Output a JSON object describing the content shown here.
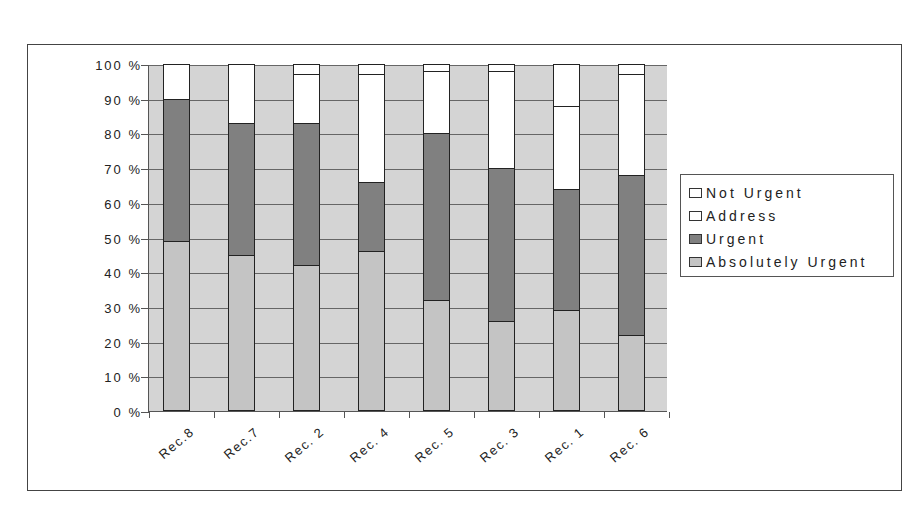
{
  "chart_data": {
    "type": "bar",
    "stacked": true,
    "percent_stacked": true,
    "title": "",
    "xlabel": "",
    "ylabel": "",
    "ylim": [
      0,
      100
    ],
    "yticks": [
      "0 %",
      "10 %",
      "20 %",
      "30 %",
      "40 %",
      "50 %",
      "60 %",
      "70 %",
      "80 %",
      "90 %",
      "100 %"
    ],
    "grid": true,
    "legend_position": "right",
    "categories": [
      "Rec.8",
      "Rec.7",
      "Rec. 2",
      "Rec. 4",
      "Rec. 5",
      "Rec. 3",
      "Rec. 1",
      "Rec. 6"
    ],
    "series": [
      {
        "name": "Absolutely Urgent",
        "color": "#c4c4c4",
        "values": [
          49,
          45,
          42,
          46,
          32,
          26,
          29,
          22
        ]
      },
      {
        "name": "Urgent",
        "color": "#808080",
        "values": [
          41,
          38,
          41,
          20,
          48,
          44,
          35,
          46
        ]
      },
      {
        "name": "Address",
        "color": "#ffffff",
        "values": [
          0,
          0,
          14,
          31,
          18,
          28,
          24,
          29
        ]
      },
      {
        "name": "Not Urgent",
        "color": "#ffffff",
        "values": [
          10,
          17,
          3,
          3,
          2,
          2,
          12,
          3
        ]
      }
    ]
  },
  "legend": {
    "items": [
      {
        "label": "Not Urgent",
        "color": "#ffffff"
      },
      {
        "label": "Address",
        "color": "#ffffff"
      },
      {
        "label": "Urgent",
        "color": "#808080"
      },
      {
        "label": "Absolutely Urgent",
        "color": "#c4c4c4"
      }
    ]
  },
  "colors": {
    "plot_background": "#d4d4d4",
    "gridline": "#666666"
  }
}
